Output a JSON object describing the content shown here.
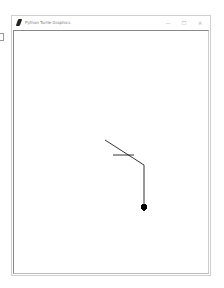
{
  "window": {
    "title": "Python Turtle Graphics",
    "controls": {
      "minimize": "—",
      "maximize": "☐",
      "close": "✕"
    }
  },
  "canvas": {
    "background": "#ffffff",
    "pen_color": "#000000",
    "segments": [
      {
        "x1": 105,
        "y1": 140,
        "x2": 144,
        "y2": 165
      },
      {
        "x1": 113,
        "y1": 155,
        "x2": 134,
        "y2": 155
      },
      {
        "x1": 144,
        "y1": 165,
        "x2": 144,
        "y2": 205
      }
    ],
    "turtle": {
      "x": 144,
      "y": 207,
      "heading": "down"
    }
  }
}
